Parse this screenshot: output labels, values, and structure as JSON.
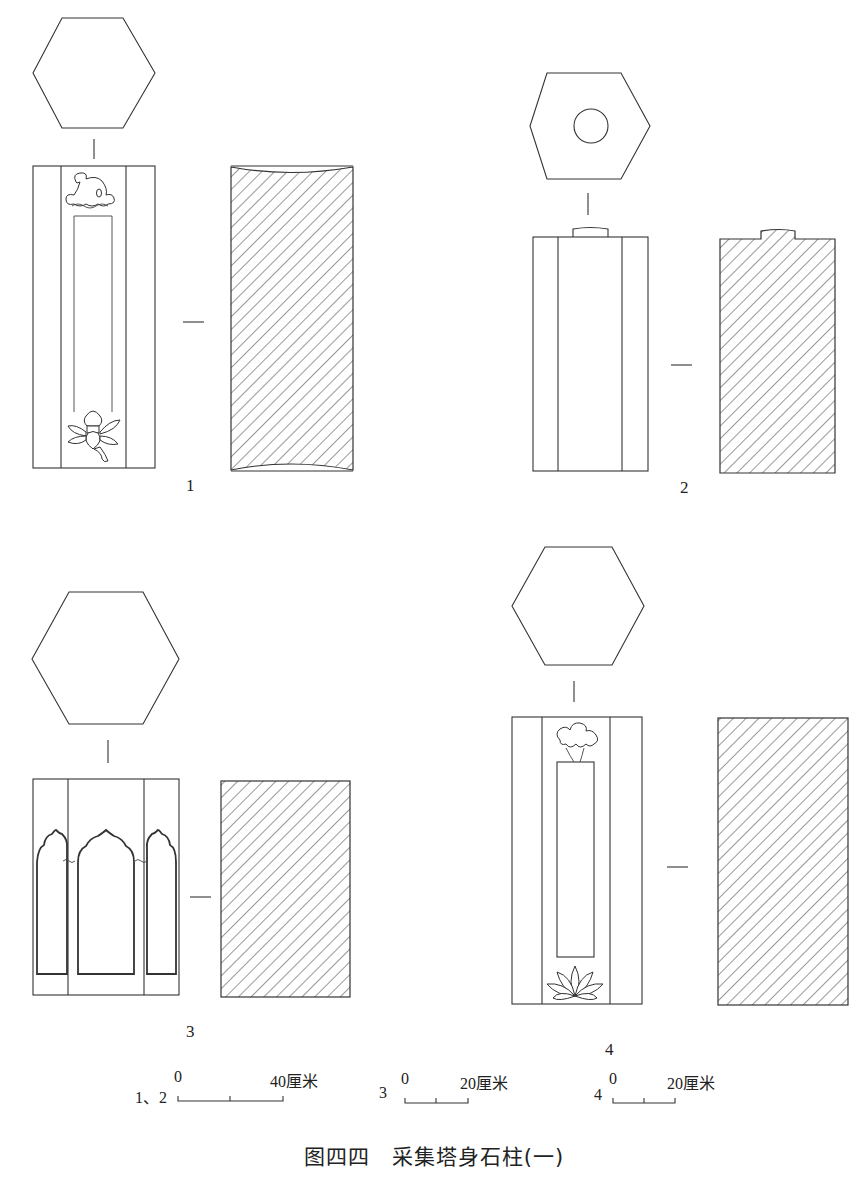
{
  "figure": {
    "caption": "图四四　采集塔身石柱(一)",
    "stroke_color": "#333333",
    "background": "#ffffff"
  },
  "objects": [
    {
      "id": "1",
      "label": "1",
      "top_view": "hexagon",
      "elevation_decoration": "cloud motif above, lotus-jewel motif below, long inscription panel",
      "section": "hatched, concave top and bottom"
    },
    {
      "id": "2",
      "label": "2",
      "top_view": "hexagon with central circular socket",
      "elevation_decoration": "plain, three faces, tenon on top",
      "section": "hatched with tenon"
    },
    {
      "id": "3",
      "label": "3",
      "top_view": "hexagon",
      "elevation_decoration": "three arched niches with ogee tops",
      "section": "hatched rectangle"
    },
    {
      "id": "4",
      "label": "4",
      "top_view": "hexagon",
      "elevation_decoration": "cloud motif above, lotus below, rectangular panel",
      "section": "hatched rectangle"
    }
  ],
  "scale_bars": [
    {
      "applies_to": "1、2",
      "start": "0",
      "end": "40厘米",
      "divisions": 2
    },
    {
      "applies_to": "3",
      "start": "0",
      "end": "20厘米",
      "divisions": 2
    },
    {
      "applies_to": "4",
      "start": "0",
      "end": "20厘米",
      "divisions": 2
    }
  ]
}
